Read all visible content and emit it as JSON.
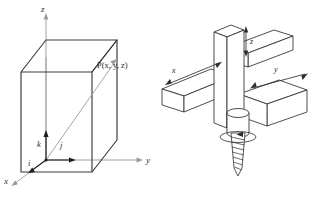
{
  "figure": {
    "background_color": "#ffffff",
    "line_color": "#3a3a3a",
    "light_line_color": "#9a9a9a",
    "text_color": "#2b2b2b",
    "panels": [
      {
        "id": "left",
        "name": "cartesian-box-diagram",
        "description": "Rectangular box with x, y, z coordinate axes, unit vectors i, j, k at origin and a position vector drawn to corner point P",
        "axis_labels": {
          "x": "x",
          "y": "y",
          "z": "z"
        },
        "unit_vectors": {
          "i": "i",
          "j": "j",
          "k": "k"
        },
        "point_label": "P(x, y, z)"
      },
      {
        "id": "right",
        "name": "wooden-beams-screw-diagram",
        "description": "Three mutually perpendicular wooden beams forming a right-handed axis frame with a screw advancing along the vertical axis",
        "axis_labels": {
          "x": "x",
          "y": "y",
          "z": "z"
        }
      }
    ]
  }
}
